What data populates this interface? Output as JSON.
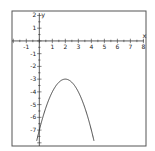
{
  "chart_data": {
    "type": "line",
    "title": "",
    "xlabel": "x",
    "ylabel": "y",
    "xlim": [
      -2.1,
      8.2
    ],
    "ylim": [
      -8.25,
      2.35
    ],
    "grid": false,
    "x_ticks": [
      -1,
      1,
      2,
      3,
      4,
      5,
      6,
      7,
      8
    ],
    "y_ticks": [
      2,
      1,
      -1,
      -2,
      -3,
      -4,
      -5,
      -6,
      -7
    ],
    "x_tick_labels": [
      "-1",
      "1",
      "2",
      "3",
      "4",
      "5",
      "6",
      "7",
      "8"
    ],
    "y_tick_labels": [
      "2",
      "1",
      "-1",
      "-2",
      "-3",
      "-4",
      "-5",
      "-6",
      "-7"
    ],
    "series": [
      {
        "name": "y = -(x-2)^2 - 3",
        "function": "-(x-2)^2 - 3",
        "vertex": [
          2,
          -3
        ],
        "x": [
          -0.2,
          0,
          0.5,
          1,
          1.5,
          2,
          2.5,
          3,
          3.5,
          4,
          4.2
        ],
        "y": [
          -7.84,
          -7,
          -5.25,
          -4,
          -3.25,
          -3,
          -3.25,
          -4,
          -5.25,
          -7,
          -7.84
        ]
      }
    ],
    "colors": {
      "curve": "#333333",
      "axes": "#333333",
      "frame": "#555555"
    }
  }
}
